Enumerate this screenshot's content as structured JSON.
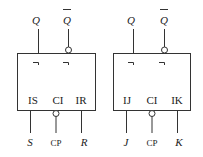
{
  "diagram": {
    "type": "flip-flop-symbols",
    "left_block": {
      "name": "RS flip-flop",
      "outputs": [
        {
          "label": "Q",
          "inverted": false,
          "delay_mark": "¬"
        },
        {
          "label": "Q̄",
          "inverted": true,
          "delay_mark": "¬"
        }
      ],
      "inputs": [
        {
          "pin_label": "IS",
          "signal": "S"
        },
        {
          "pin_label": "CI",
          "signal": "CP",
          "inverted": true
        },
        {
          "pin_label": "IR",
          "signal": "R"
        }
      ]
    },
    "right_block": {
      "name": "JK flip-flop",
      "outputs": [
        {
          "label": "Q",
          "inverted": false,
          "delay_mark": "¬"
        },
        {
          "label": "Q̄",
          "inverted": true,
          "delay_mark": "¬"
        }
      ],
      "inputs": [
        {
          "pin_label": "IJ",
          "signal": "J"
        },
        {
          "pin_label": "CI",
          "signal": "CP",
          "inverted": true
        },
        {
          "pin_label": "IK",
          "signal": "K"
        }
      ]
    }
  },
  "labels": {
    "q": "Q",
    "qbar": "Q",
    "delay": "¬",
    "l_in1": "IS",
    "l_in2": "CI",
    "l_in3": "IR",
    "l_sig1": "S",
    "l_sig2": "CP",
    "l_sig3": "R",
    "r_in1": "IJ",
    "r_in2": "CI",
    "r_in3": "IK",
    "r_sig1": "J",
    "r_sig2": "CP",
    "r_sig3": "K"
  }
}
